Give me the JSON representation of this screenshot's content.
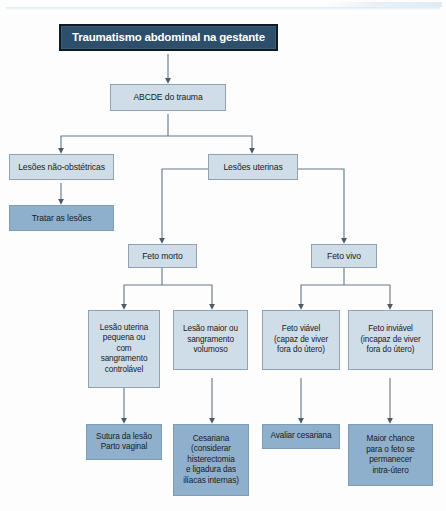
{
  "diagram": {
    "title": "Traumatismo abdominal na gestante",
    "language": "pt-BR",
    "type": "flowchart",
    "colors": {
      "title_fill": "#2e4f6b",
      "title_border": "#101a22",
      "title_text": "#ffffff",
      "process_fill": "#cfdde8",
      "process_border": "#8fa3b2",
      "terminal_fill": "#8fb0cc",
      "terminal_border": "#7e9cb5",
      "connector": "#6b7b88",
      "page_background": "#fdfdfd"
    },
    "nodes": {
      "root": "Traumatismo abdominal na gestante",
      "abcde": "ABCDE do trauma",
      "lesoes_nao_obstetricas": "Lesões não-obstétricas",
      "tratar_as_lesoes": "Tratar as lesões",
      "lesoes_uterinas": "Lesões uterinas",
      "feto_morto": "Feto morto",
      "feto_vivo": "Feto vivo",
      "lesao_uterina_pequena": "Lesão uterina\npequena  ou\ncom\nsangramento\ncontrolável",
      "lesao_maior": "Lesão maior ou\nsangramento\nvolumoso",
      "feto_viavel": "Feto viável\n(capaz de viver\nfora do  útero)",
      "feto_inviavel": "Feto inviável\n(incapaz de viver\nfora do  útero)",
      "sutura_parto": "Sutura da lesão\nParto vaginal",
      "cesariana": "Cesariana\n(considerar\nhisterectomia\ne ligadura das\nilíacas internas)",
      "avaliar_cesariana": "Avaliar cesariana",
      "maior_chance": "Maior chance\npara o feto se\npermanecer\nintra-útero"
    },
    "edges": [
      {
        "from": "root",
        "to": "abcde"
      },
      {
        "from": "abcde",
        "to": "lesoes_nao_obstetricas"
      },
      {
        "from": "abcde",
        "to": "lesoes_uterinas"
      },
      {
        "from": "lesoes_nao_obstetricas",
        "to": "tratar_as_lesoes"
      },
      {
        "from": "lesoes_uterinas",
        "to": "feto_morto"
      },
      {
        "from": "lesoes_uterinas",
        "to": "feto_vivo"
      },
      {
        "from": "feto_morto",
        "to": "lesao_uterina_pequena"
      },
      {
        "from": "feto_morto",
        "to": "lesao_maior"
      },
      {
        "from": "feto_vivo",
        "to": "feto_viavel"
      },
      {
        "from": "feto_vivo",
        "to": "feto_inviavel"
      },
      {
        "from": "lesao_uterina_pequena",
        "to": "sutura_parto"
      },
      {
        "from": "lesao_maior",
        "to": "cesariana"
      },
      {
        "from": "feto_viavel",
        "to": "avaliar_cesariana"
      },
      {
        "from": "feto_inviavel",
        "to": "maior_chance"
      }
    ]
  }
}
